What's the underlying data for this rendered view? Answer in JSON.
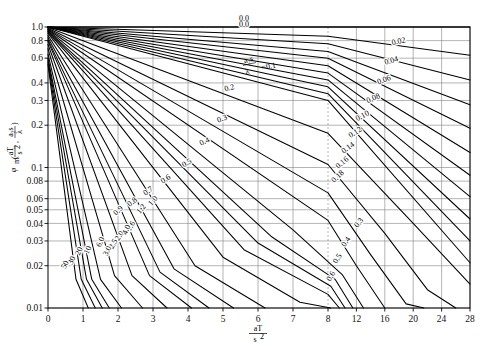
{
  "figure": {
    "name": "transient-conduction-chart",
    "background": "#ffffff",
    "line_color": "#000000",
    "grid_color": "#777777"
  },
  "axes": {
    "x": {
      "label_num": "aT",
      "label_den": "s",
      "label_den_exp": "2",
      "ticks": [
        "0",
        "1",
        "2",
        "3",
        "4",
        "5",
        "6",
        "7",
        "8",
        "12",
        "16",
        "20",
        "24",
        "28"
      ],
      "values": [
        0,
        1,
        2,
        3,
        4,
        5,
        6,
        7,
        8,
        12,
        16,
        20,
        24,
        28
      ],
      "break_at": 8,
      "min": 0,
      "max": 28
    },
    "y": {
      "label_phi": "φ",
      "label_sub": "m",
      "label_arg1_num": "aT",
      "label_arg1_den": "s",
      "label_arg1_exp": "2",
      "label_arg2_num": "a₂s",
      "label_arg2_den": "λ",
      "scale": "log",
      "ticks": [
        "1.0",
        "0.8",
        "0.6",
        "0.4",
        "0.3",
        "0.2",
        "0.1",
        "0.08",
        "0.06",
        "0.05",
        "0.04",
        "0.03",
        "0.02",
        "0.01"
      ],
      "values": [
        1.0,
        0.8,
        0.6,
        0.4,
        0.3,
        0.2,
        0.1,
        0.08,
        0.06,
        0.05,
        0.04,
        0.03,
        0.02,
        0.01
      ],
      "min": 0.01,
      "max": 1.0
    }
  },
  "param_legend": {
    "symbol_num": "a₂s",
    "symbol_den": "λ",
    "equals": "=0.1"
  },
  "chart_data": {
    "type": "line",
    "title": "",
    "subtitle": "",
    "xlabel": "aT/s²",
    "ylabel": "φm(aT/s², a₂s/λ)",
    "xlim": [
      0,
      28
    ],
    "ylim": [
      0.01,
      1.0
    ],
    "yscale": "log",
    "xscale": "piecewise-linear (0-8 linear, 8-28 compressed)",
    "grid": true,
    "legend_position": "inline-curve-labels",
    "series_parameter": "a₂s/λ (Biot number)",
    "annotations": [
      {
        "text": "0.0",
        "x": 5.6,
        "y": 1.02
      },
      {
        "text": "=0.1",
        "x": 4.6,
        "y": 0.63
      }
    ],
    "series": [
      {
        "name": "0.0",
        "label": "0.0",
        "points": [
          [
            0,
            1.0
          ],
          [
            8,
            1.0
          ],
          [
            28,
            1.0
          ]
        ]
      },
      {
        "name": "0.02",
        "label": "0.02",
        "points": [
          [
            0,
            1.0
          ],
          [
            8,
            0.86
          ],
          [
            28,
            0.63
          ]
        ]
      },
      {
        "name": "0.04",
        "label": "0.04",
        "points": [
          [
            0,
            1.0
          ],
          [
            8,
            0.76
          ],
          [
            28,
            0.42
          ]
        ]
      },
      {
        "name": "0.06",
        "label": "0.06",
        "points": [
          [
            0,
            1.0
          ],
          [
            8,
            0.67
          ],
          [
            28,
            0.28
          ]
        ]
      },
      {
        "name": "0.08",
        "label": "0.08",
        "points": [
          [
            0,
            1.0
          ],
          [
            8,
            0.6
          ],
          [
            28,
            0.19
          ]
        ]
      },
      {
        "name": "0.10",
        "label": "0.10",
        "points": [
          [
            0,
            1.0
          ],
          [
            8,
            0.53
          ],
          [
            28,
            0.128
          ]
        ]
      },
      {
        "name": "0.12",
        "label": "0.12",
        "points": [
          [
            0,
            1.0
          ],
          [
            8,
            0.47
          ],
          [
            28,
            0.088
          ]
        ]
      },
      {
        "name": "0.14",
        "label": "0.14",
        "points": [
          [
            0,
            1.0
          ],
          [
            8,
            0.42
          ],
          [
            28,
            0.062
          ]
        ]
      },
      {
        "name": "0.16",
        "label": "0.16",
        "points": [
          [
            0,
            1.0
          ],
          [
            8,
            0.375
          ],
          [
            28,
            0.043
          ]
        ]
      },
      {
        "name": "0.18",
        "label": "0.18",
        "points": [
          [
            0,
            1.0
          ],
          [
            8,
            0.335
          ],
          [
            28,
            0.03
          ]
        ]
      },
      {
        "name": "0.2",
        "label": "0.2",
        "points": [
          [
            0,
            1.0
          ],
          [
            8,
            0.3
          ],
          [
            28,
            0.021
          ]
        ]
      },
      {
        "name": "0.3",
        "label": "0.3",
        "points": [
          [
            0,
            0.99
          ],
          [
            8,
            0.175
          ],
          [
            20,
            0.04
          ],
          [
            28,
            0.0148
          ]
        ]
      },
      {
        "name": "0.4",
        "label": "0.4",
        "points": [
          [
            0,
            0.98
          ],
          [
            8,
            0.105
          ],
          [
            16,
            0.034
          ],
          [
            22,
            0.0135
          ],
          [
            26,
            0.01
          ]
        ]
      },
      {
        "name": "0.5",
        "label": "0.5",
        "points": [
          [
            0,
            0.97
          ],
          [
            8,
            0.066
          ],
          [
            14,
            0.024
          ],
          [
            19,
            0.0107
          ],
          [
            21.5,
            0.01
          ]
        ]
      },
      {
        "name": "0.6",
        "label": "0.6",
        "points": [
          [
            0,
            0.96
          ],
          [
            8,
            0.042
          ],
          [
            12,
            0.02
          ],
          [
            16,
            0.01
          ]
        ]
      },
      {
        "name": "0.7",
        "label": "0.7",
        "points": [
          [
            0,
            0.95
          ],
          [
            7,
            0.036
          ],
          [
            10,
            0.0173
          ],
          [
            13,
            0.01
          ]
        ]
      },
      {
        "name": "0.8",
        "label": "0.8",
        "points": [
          [
            0,
            0.94
          ],
          [
            6.4,
            0.032
          ],
          [
            9,
            0.016
          ],
          [
            11.5,
            0.01
          ]
        ]
      },
      {
        "name": "0.9",
        "label": "0.9",
        "points": [
          [
            0,
            0.93
          ],
          [
            6.0,
            0.029
          ],
          [
            8.4,
            0.0143
          ],
          [
            10.4,
            0.01
          ]
        ]
      },
      {
        "name": "1.0",
        "label": "1.0",
        "points": [
          [
            0,
            0.92
          ],
          [
            5.6,
            0.026
          ],
          [
            8,
            0.0125
          ],
          [
            9.6,
            0.01
          ]
        ]
      },
      {
        "name": "1.2",
        "label": "1.2",
        "points": [
          [
            0,
            0.9
          ],
          [
            5.0,
            0.023
          ],
          [
            7.2,
            0.011
          ],
          [
            8.4,
            0.01
          ]
        ]
      },
      {
        "name": "1.6",
        "label": "1.6",
        "points": [
          [
            0,
            0.87
          ],
          [
            4.2,
            0.02
          ],
          [
            6.2,
            0.01
          ]
        ]
      },
      {
        "name": "2.0",
        "label": "2.0",
        "points": [
          [
            0,
            0.84
          ],
          [
            3.6,
            0.019
          ],
          [
            5.3,
            0.01
          ]
        ]
      },
      {
        "name": "2.5",
        "label": "2.5",
        "points": [
          [
            0,
            0.81
          ],
          [
            3.2,
            0.018
          ],
          [
            4.6,
            0.01
          ]
        ]
      },
      {
        "name": "3.0",
        "label": "3.0",
        "points": [
          [
            0,
            0.79
          ],
          [
            2.9,
            0.017
          ],
          [
            4.1,
            0.01
          ]
        ]
      },
      {
        "name": "4.0",
        "label": "4.0",
        "points": [
          [
            0,
            0.75
          ],
          [
            2.4,
            0.017
          ],
          [
            3.4,
            0.01
          ]
        ]
      },
      {
        "name": "6.0",
        "label": "6.0",
        "points": [
          [
            0,
            0.7
          ],
          [
            1.9,
            0.017
          ],
          [
            2.7,
            0.01
          ]
        ]
      },
      {
        "name": "10",
        "label": "10",
        "points": [
          [
            0,
            0.64
          ],
          [
            1.5,
            0.016
          ],
          [
            2.1,
            0.01
          ]
        ]
      },
      {
        "name": "16",
        "label": "16",
        "points": [
          [
            0,
            0.6
          ],
          [
            1.25,
            0.016
          ],
          [
            1.75,
            0.01
          ]
        ]
      },
      {
        "name": "20",
        "label": "20",
        "points": [
          [
            0,
            0.58
          ],
          [
            1.1,
            0.016
          ],
          [
            1.55,
            0.01
          ]
        ]
      },
      {
        "name": "30",
        "label": "30",
        "points": [
          [
            0,
            0.56
          ],
          [
            0.95,
            0.016
          ],
          [
            1.35,
            0.01
          ]
        ]
      },
      {
        "name": "50",
        "label": "50",
        "points": [
          [
            0,
            0.54
          ],
          [
            0.8,
            0.016
          ],
          [
            1.15,
            0.01
          ]
        ]
      }
    ],
    "curve_label_positions": [
      {
        "label": "0.0",
        "x": 5.6,
        "y": 1.055,
        "rot": 0
      },
      {
        "label": "0.02",
        "x": 18.0,
        "y": 0.76,
        "rot": -12
      },
      {
        "label": "0.04",
        "x": 17.0,
        "y": 0.555,
        "rot": -16
      },
      {
        "label": "0.06",
        "x": 16.0,
        "y": 0.405,
        "rot": -20
      },
      {
        "label": "0.08",
        "x": 14.5,
        "y": 0.3,
        "rot": -24
      },
      {
        "label": "0.10",
        "x": 13.0,
        "y": 0.225,
        "rot": -28
      },
      {
        "label": "0.12",
        "x": 12.0,
        "y": 0.172,
        "rot": -32
      },
      {
        "label": "0.14",
        "x": 11.0,
        "y": 0.134,
        "rot": -36
      },
      {
        "label": "0.16",
        "x": 10.2,
        "y": 0.105,
        "rot": -40
      },
      {
        "label": "0.18",
        "x": 9.6,
        "y": 0.084,
        "rot": -44
      },
      {
        "label": "0.2",
        "x": 5.2,
        "y": 0.355,
        "rot": -16
      },
      {
        "label": "0.3",
        "x": 5.0,
        "y": 0.215,
        "rot": -22
      },
      {
        "label": "0.4",
        "x": 4.5,
        "y": 0.148,
        "rot": -26
      },
      {
        "label": "0.5",
        "x": 4.0,
        "y": 0.104,
        "rot": -30
      },
      {
        "label": "0.6",
        "x": 3.4,
        "y": 0.08,
        "rot": -33
      },
      {
        "label": "0.7",
        "x": 2.9,
        "y": 0.066,
        "rot": -36
      },
      {
        "label": "0.8",
        "x": 2.45,
        "y": 0.055,
        "rot": -39
      },
      {
        "label": "0.9",
        "x": 2.05,
        "y": 0.048,
        "rot": -42
      },
      {
        "label": "1.0",
        "x": 3.05,
        "y": 0.0565,
        "rot": -50
      },
      {
        "label": "1.2",
        "x": 2.72,
        "y": 0.0495,
        "rot": -52
      },
      {
        "label": "1.6",
        "x": 2.42,
        "y": 0.0375,
        "rot": -56
      },
      {
        "label": "2.0",
        "x": 2.1,
        "y": 0.032,
        "rot": -58
      },
      {
        "label": "2.5",
        "x": 1.92,
        "y": 0.028,
        "rot": -60
      },
      {
        "label": "3.0",
        "x": 1.75,
        "y": 0.025,
        "rot": -62
      },
      {
        "label": "4.0",
        "x": 2.3,
        "y": 0.0355,
        "rot": -66
      },
      {
        "label": "6.0",
        "x": 1.56,
        "y": 0.029,
        "rot": -66
      },
      {
        "label": "10",
        "x": 1.2,
        "y": 0.0255,
        "rot": -66
      },
      {
        "label": "20",
        "x": 0.95,
        "y": 0.025,
        "rot": -66
      },
      {
        "label": "30",
        "x": 0.74,
        "y": 0.0215,
        "rot": -66
      },
      {
        "label": "50",
        "x": 0.55,
        "y": 0.02,
        "rot": -66
      },
      {
        "label": "0.3",
        "x": 12.6,
        "y": 0.0395,
        "rot": -52
      },
      {
        "label": "0.4",
        "x": 10.8,
        "y": 0.029,
        "rot": -55
      },
      {
        "label": "0.5",
        "x": 9.6,
        "y": 0.022,
        "rot": -58
      },
      {
        "label": "0.6",
        "x": 8.7,
        "y": 0.0165,
        "rot": -60
      }
    ]
  }
}
